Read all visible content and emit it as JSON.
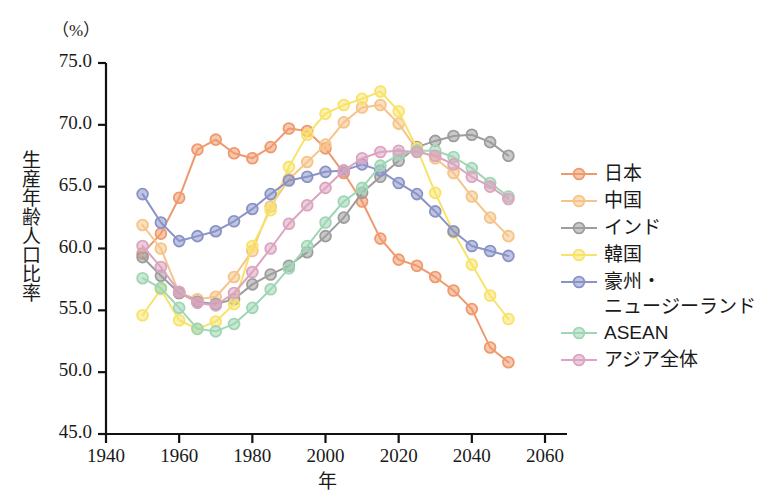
{
  "chart_data": {
    "type": "line",
    "title": "",
    "unit_label": "（%）",
    "xlabel": "年",
    "ylabel": "生産年齢人口比率",
    "xlim": [
      1940,
      2060
    ],
    "ylim": [
      45.0,
      75.0
    ],
    "grid": false,
    "legend_position": "right",
    "xticks": [
      1940,
      1960,
      1980,
      2000,
      2020,
      2040,
      2060
    ],
    "xtick_labels": [
      "1940",
      "1960",
      "1980",
      "2000",
      "2020",
      "2040",
      "2060"
    ],
    "yticks": [
      45.0,
      50.0,
      55.0,
      60.0,
      65.0,
      70.0,
      75.0
    ],
    "ytick_labels": [
      "45.0",
      "50.0",
      "55.0",
      "60.0",
      "65.0",
      "70.0",
      "75.0"
    ],
    "x": [
      1950,
      1955,
      1960,
      1965,
      1970,
      1975,
      1980,
      1985,
      1990,
      1995,
      2000,
      2005,
      2010,
      2015,
      2020,
      2025,
      2030,
      2035,
      2040,
      2045,
      2050
    ],
    "series": [
      {
        "name": "日本",
        "color": "#ef9a6e",
        "values": [
          59.6,
          61.2,
          64.1,
          68.0,
          68.8,
          67.7,
          67.3,
          68.2,
          69.7,
          69.5,
          68.1,
          66.1,
          63.8,
          60.8,
          59.1,
          58.6,
          57.7,
          56.6,
          55.1,
          52.0,
          50.8
        ]
      },
      {
        "name": "中国",
        "color": "#f5c489",
        "values": [
          61.9,
          60.0,
          56.4,
          55.9,
          56.1,
          57.7,
          59.8,
          63.4,
          65.6,
          67.0,
          68.4,
          70.2,
          71.4,
          71.6,
          70.1,
          68.0,
          67.3,
          66.1,
          64.2,
          62.5,
          61.0
        ]
      },
      {
        "name": "インド",
        "color": "#9d9d9d",
        "values": [
          59.3,
          57.8,
          56.4,
          55.7,
          55.5,
          55.9,
          57.1,
          57.9,
          58.6,
          59.7,
          61.0,
          62.5,
          64.5,
          65.8,
          67.1,
          68.2,
          68.7,
          69.1,
          69.2,
          68.6,
          67.5
        ]
      },
      {
        "name": "韓国",
        "color": "#f7e36a",
        "values": [
          54.6,
          56.7,
          54.2,
          53.5,
          54.1,
          55.5,
          60.2,
          63.1,
          66.6,
          69.2,
          70.9,
          71.6,
          72.1,
          72.7,
          71.1,
          68.1,
          64.5,
          61.3,
          58.7,
          56.2,
          54.3
        ]
      },
      {
        "name": "豪州・\nニュージーランド",
        "color": "#8a93c6",
        "values": [
          64.4,
          62.1,
          60.6,
          61.0,
          61.4,
          62.2,
          63.2,
          64.4,
          65.5,
          65.8,
          66.2,
          66.3,
          66.8,
          66.3,
          65.3,
          64.4,
          63.0,
          61.4,
          60.2,
          59.8,
          59.4
        ]
      },
      {
        "name": "ASEAN",
        "color": "#9fd6b5",
        "values": [
          57.6,
          56.8,
          55.2,
          53.5,
          53.3,
          53.9,
          55.2,
          56.7,
          58.4,
          60.2,
          62.1,
          63.8,
          64.9,
          66.7,
          67.6,
          67.9,
          67.9,
          67.4,
          66.5,
          65.3,
          64.2
        ]
      },
      {
        "name": "アジア全体",
        "color": "#dba4c0",
        "values": [
          60.2,
          58.5,
          56.5,
          55.6,
          55.4,
          56.4,
          58.1,
          60.0,
          62.0,
          63.5,
          64.9,
          66.3,
          67.3,
          67.8,
          67.9,
          67.8,
          67.5,
          66.8,
          65.8,
          65.0,
          64.0
        ]
      }
    ]
  },
  "legend": {
    "items": [
      {
        "label": "日本",
        "color": "#ef9a6e",
        "continuation": ""
      },
      {
        "label": "中国",
        "color": "#f5c489",
        "continuation": ""
      },
      {
        "label": "インド",
        "color": "#9d9d9d",
        "continuation": ""
      },
      {
        "label": "韓国",
        "color": "#f7e36a",
        "continuation": ""
      },
      {
        "label": "豪州・",
        "color": "#8a93c6",
        "continuation": "ニュージーランド"
      },
      {
        "label": "ASEAN",
        "color": "#9fd6b5",
        "continuation": ""
      },
      {
        "label": "アジア全体",
        "color": "#dba4c0",
        "continuation": ""
      }
    ]
  },
  "axes": {
    "unit": "（%）",
    "y_title": "生産年齢人口比率",
    "x_title": "年"
  }
}
